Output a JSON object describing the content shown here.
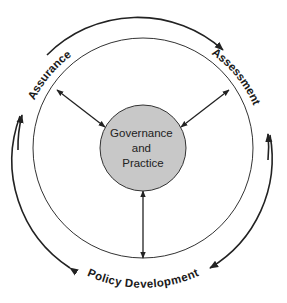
{
  "diagram": {
    "center_node": {
      "lines": [
        "Governance",
        "and",
        "Practice"
      ],
      "fill": "#c8c8c8",
      "stroke": "#333333"
    },
    "outer_labels": {
      "assurance": "Assurance",
      "assessment": "Assessment",
      "policy_development": "Policy Development"
    },
    "cycle_direction": "clockwise",
    "connectors": [
      {
        "from": "Governance and Practice",
        "to": "Assurance",
        "type": "bidirectional"
      },
      {
        "from": "Governance and Practice",
        "to": "Assessment",
        "type": "bidirectional"
      },
      {
        "from": "Governance and Practice",
        "to": "Policy Development",
        "type": "bidirectional"
      }
    ],
    "colors": {
      "line": "#222222",
      "background": "#ffffff"
    }
  }
}
